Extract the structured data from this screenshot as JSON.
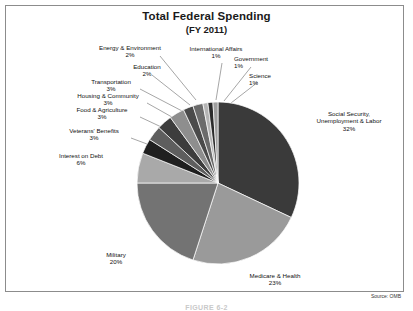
{
  "figure": {
    "title": "Total Federal Spending",
    "subtitle": "(FY 2011)",
    "source": "Source: OMB",
    "caption": "FIGURE 6-2"
  },
  "chart_data": {
    "type": "pie",
    "title": "Total Federal Spending",
    "subtitle": "(FY 2011)",
    "source": "Source: OMB",
    "unit": "percent",
    "start_angle_deg": 0,
    "direction": "clockwise",
    "categories": [
      "Social Security, Unemployment & Labor",
      "Medicare & Health",
      "Military",
      "Interest on Debt",
      "Veterans' Benefits",
      "Food & Agriculture",
      "Housing & Community",
      "Transportation",
      "Education",
      "Energy & Environment",
      "International Affairs",
      "Government",
      "Science"
    ],
    "values": [
      32,
      23,
      20,
      6,
      3,
      3,
      3,
      3,
      2,
      2,
      1,
      1,
      1
    ],
    "labels": [
      "Social Security,\nUnemployment & Labor",
      "Medicare & Health",
      "Military",
      "Interest on Debt",
      "Veterans' Benefits",
      "Food & Agriculture",
      "Housing & Community",
      "Transportation",
      "Education",
      "Energy & Environment",
      "International Affairs",
      "Government",
      "Science"
    ],
    "colors": [
      "#3a3a3a",
      "#9a9a9a",
      "#737373",
      "#a9a9a9",
      "#1f1f1f",
      "#5e5e5e",
      "#3d3d3d",
      "#8e8e8e",
      "#4a4a4a",
      "#6b6b6b",
      "#b4b4b4",
      "#2c2c2c",
      "#9f9f9f"
    ],
    "legend": false,
    "grid": false
  },
  "slices": [
    {
      "name": "Social Security, Unemployment & Labor",
      "line1": "Social Security,",
      "line2": "Unemployment & Labor",
      "pct": "32%"
    },
    {
      "name": "Medicare & Health",
      "line1": "Medicare & Health",
      "pct": "23%"
    },
    {
      "name": "Military",
      "line1": "Military",
      "pct": "20%"
    },
    {
      "name": "Interest on Debt",
      "line1": "Interest on Debt",
      "pct": "6%"
    },
    {
      "name": "Veterans' Benefits",
      "line1": "Veterans' Benefits",
      "pct": "3%"
    },
    {
      "name": "Food & Agriculture",
      "line1": "Food & Agriculture",
      "pct": "3%"
    },
    {
      "name": "Housing & Community",
      "line1": "Housing & Community",
      "pct": "3%"
    },
    {
      "name": "Transportation",
      "line1": "Transportation",
      "pct": "3%"
    },
    {
      "name": "Education",
      "line1": "Education",
      "pct": "2%"
    },
    {
      "name": "Energy & Environment",
      "line1": "Energy & Environment",
      "pct": "2%"
    },
    {
      "name": "International Affairs",
      "line1": "International Affairs",
      "pct": "1%"
    },
    {
      "name": "Government",
      "line1": "Government",
      "pct": "1%"
    },
    {
      "name": "Science",
      "line1": "Science",
      "pct": "1%"
    }
  ]
}
